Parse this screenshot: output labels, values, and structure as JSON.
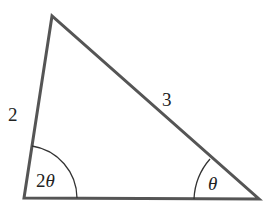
{
  "diagram": {
    "type": "triangle",
    "colors": {
      "stroke": "#555555",
      "arc": "#333333",
      "text": "#222222",
      "background": "#ffffff"
    },
    "vertices": {
      "top": [
        52,
        16
      ],
      "bottom_left": [
        24,
        198
      ],
      "bottom_right": [
        259,
        199
      ]
    },
    "sides": {
      "left": {
        "label": "2"
      },
      "hypotenuse": {
        "label": "3"
      }
    },
    "angles": {
      "bottom_left": {
        "label_coef": "2",
        "label_var": "θ"
      },
      "bottom_right": {
        "label": "θ"
      }
    }
  }
}
